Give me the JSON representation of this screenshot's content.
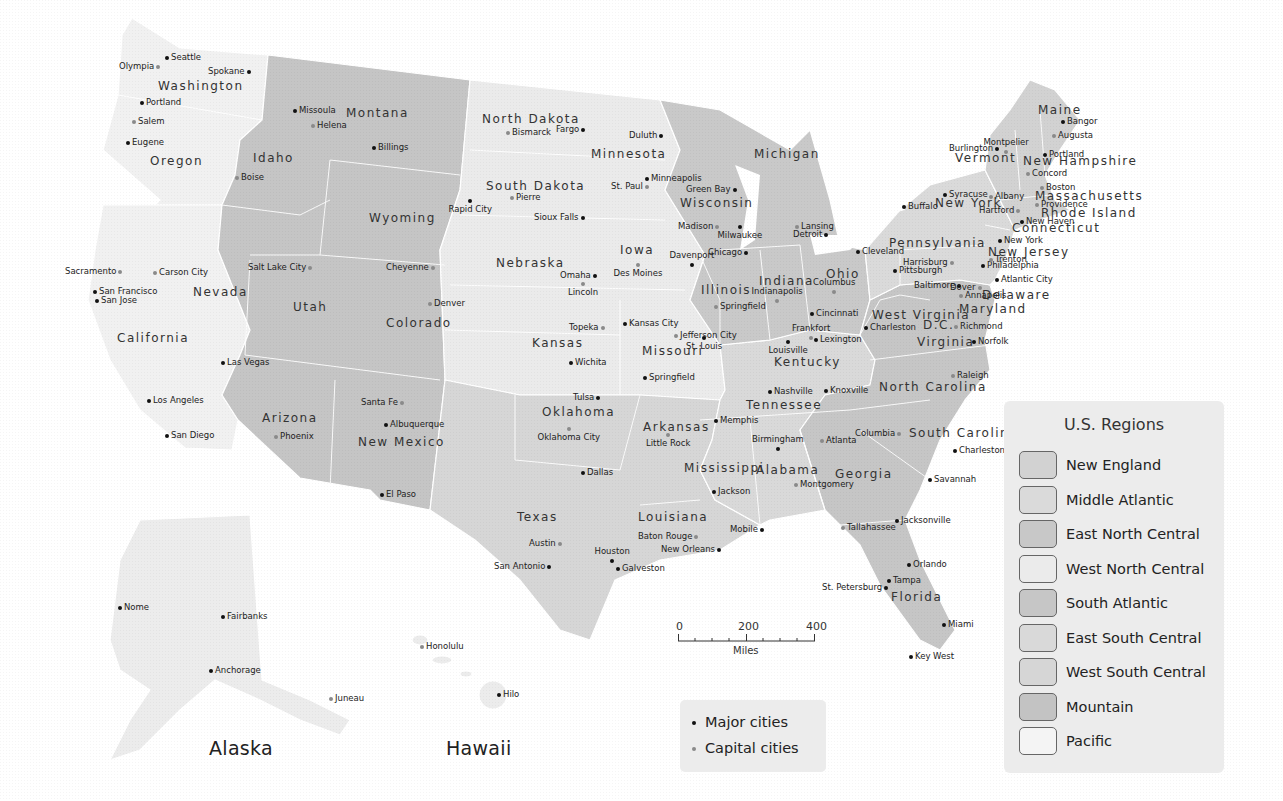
{
  "title": "U.S. Regions",
  "colors": {
    "new_england": "#d2d2d2",
    "middle_atlantic": "#dadada",
    "east_north_central": "#c8c8c8",
    "west_north_central": "#ebebeb",
    "south_atlantic": "#c6c6c6",
    "east_south_central": "#d9d9d9",
    "west_south_central": "#d6d6d6",
    "mountain": "#c3c3c3",
    "pacific": "#f2f2f2",
    "major_dot": "#111111",
    "capital_dot": "#8a8a8a"
  },
  "legend": {
    "title": "U.S. Regions",
    "items": [
      {
        "label": "New England",
        "color": "#d2d2d2"
      },
      {
        "label": "Middle Atlantic",
        "color": "#dadada"
      },
      {
        "label": "East North Central",
        "color": "#c8c8c8"
      },
      {
        "label": "West North Central",
        "color": "#ebebeb"
      },
      {
        "label": "South Atlantic",
        "color": "#c6c6c6"
      },
      {
        "label": "East South Central",
        "color": "#d9d9d9"
      },
      {
        "label": "West South Central",
        "color": "#d6d6d6"
      },
      {
        "label": "Mountain",
        "color": "#c3c3c3"
      },
      {
        "label": "Pacific",
        "color": "#f4f4f4"
      }
    ]
  },
  "city_legend": {
    "major": "Major cities",
    "capital": "Capital cities"
  },
  "scale": {
    "ticks": [
      "0",
      "200",
      "400"
    ],
    "unit": "Miles"
  },
  "insets": {
    "alaska": "Alaska",
    "hawaii": "Hawaii"
  },
  "states": [
    {
      "name": "Washington",
      "x": 158,
      "y": 80
    },
    {
      "name": "Oregon",
      "x": 150,
      "y": 155
    },
    {
      "name": "California",
      "x": 117,
      "y": 332
    },
    {
      "name": "Nevada",
      "x": 193,
      "y": 286
    },
    {
      "name": "Idaho",
      "x": 253,
      "y": 152
    },
    {
      "name": "Montana",
      "x": 346,
      "y": 107
    },
    {
      "name": "Wyoming",
      "x": 369,
      "y": 212
    },
    {
      "name": "Utah",
      "x": 293,
      "y": 301
    },
    {
      "name": "Colorado",
      "x": 386,
      "y": 317
    },
    {
      "name": "Arizona",
      "x": 262,
      "y": 412
    },
    {
      "name": "New Mexico",
      "x": 358,
      "y": 436
    },
    {
      "name": "North Dakota",
      "x": 482,
      "y": 113
    },
    {
      "name": "South Dakota",
      "x": 486,
      "y": 180
    },
    {
      "name": "Nebraska",
      "x": 496,
      "y": 257
    },
    {
      "name": "Kansas",
      "x": 532,
      "y": 337
    },
    {
      "name": "Oklahoma",
      "x": 542,
      "y": 406
    },
    {
      "name": "Texas",
      "x": 517,
      "y": 511
    },
    {
      "name": "Minnesota",
      "x": 591,
      "y": 148
    },
    {
      "name": "Iowa",
      "x": 620,
      "y": 244
    },
    {
      "name": "Missouri",
      "x": 642,
      "y": 345
    },
    {
      "name": "Arkansas",
      "x": 643,
      "y": 421
    },
    {
      "name": "Louisiana",
      "x": 638,
      "y": 511
    },
    {
      "name": "Wisconsin",
      "x": 680,
      "y": 197
    },
    {
      "name": "Illinois",
      "x": 701,
      "y": 284
    },
    {
      "name": "Michigan",
      "x": 754,
      "y": 148
    },
    {
      "name": "Indiana",
      "x": 759,
      "y": 275
    },
    {
      "name": "Ohio",
      "x": 826,
      "y": 268
    },
    {
      "name": "Kentucky",
      "x": 774,
      "y": 356
    },
    {
      "name": "Tennessee",
      "x": 746,
      "y": 399
    },
    {
      "name": "Mississippi",
      "x": 684,
      "y": 462
    },
    {
      "name": "Alabama",
      "x": 756,
      "y": 464
    },
    {
      "name": "Georgia",
      "x": 835,
      "y": 468
    },
    {
      "name": "Florida",
      "x": 891,
      "y": 591
    },
    {
      "name": "South Carolina",
      "x": 909,
      "y": 427
    },
    {
      "name": "North Carolina",
      "x": 879,
      "y": 381
    },
    {
      "name": "Virginia",
      "x": 917,
      "y": 336
    },
    {
      "name": "West Virginia",
      "x": 872,
      "y": 309
    },
    {
      "name": "D.C.",
      "x": 923,
      "y": 319
    },
    {
      "name": "Maryland",
      "x": 959,
      "y": 303
    },
    {
      "name": "Delaware",
      "x": 982,
      "y": 289
    },
    {
      "name": "Pennsylvania",
      "x": 889,
      "y": 237
    },
    {
      "name": "New Jersey",
      "x": 988,
      "y": 246
    },
    {
      "name": "New York",
      "x": 935,
      "y": 197
    },
    {
      "name": "Connecticut",
      "x": 1012,
      "y": 222
    },
    {
      "name": "Rhode Island",
      "x": 1041,
      "y": 207
    },
    {
      "name": "Massachusetts",
      "x": 1035,
      "y": 190
    },
    {
      "name": "Vermont",
      "x": 955,
      "y": 152
    },
    {
      "name": "New Hampshire",
      "x": 1023,
      "y": 155
    },
    {
      "name": "Maine",
      "x": 1038,
      "y": 104
    }
  ],
  "cities": [
    {
      "name": "Seattle",
      "type": "major",
      "x": 167,
      "y": 58,
      "side": "r"
    },
    {
      "name": "Olympia",
      "type": "capital",
      "x": 158,
      "y": 67,
      "side": "l"
    },
    {
      "name": "Spokane",
      "type": "major",
      "x": 249,
      "y": 72,
      "side": "l"
    },
    {
      "name": "Portland",
      "type": "major",
      "x": 142,
      "y": 103,
      "side": "r"
    },
    {
      "name": "Salem",
      "type": "capital",
      "x": 134,
      "y": 122,
      "side": "r"
    },
    {
      "name": "Eugene",
      "type": "major",
      "x": 128,
      "y": 143,
      "side": "r"
    },
    {
      "name": "Boise",
      "type": "capital",
      "x": 237,
      "y": 178,
      "side": "r"
    },
    {
      "name": "Missoula",
      "type": "major",
      "x": 295,
      "y": 111,
      "side": "r"
    },
    {
      "name": "Helena",
      "type": "capital",
      "x": 313,
      "y": 126,
      "side": "r"
    },
    {
      "name": "Billings",
      "type": "major",
      "x": 374,
      "y": 148,
      "side": "r"
    },
    {
      "name": "Cheyenne",
      "type": "capital",
      "x": 433,
      "y": 268,
      "side": "l"
    },
    {
      "name": "Salt Lake City",
      "type": "capital",
      "x": 310,
      "y": 268,
      "side": "l"
    },
    {
      "name": "Sacramento",
      "type": "capital",
      "x": 120,
      "y": 272,
      "side": "l"
    },
    {
      "name": "Carson City",
      "type": "capital",
      "x": 155,
      "y": 273,
      "side": "r"
    },
    {
      "name": "San Francisco",
      "type": "major",
      "x": 95,
      "y": 292,
      "side": "r"
    },
    {
      "name": "San Jose",
      "type": "major",
      "x": 97,
      "y": 301,
      "side": "r"
    },
    {
      "name": "Denver",
      "type": "capital",
      "x": 430,
      "y": 304,
      "side": "r"
    },
    {
      "name": "Las Vegas",
      "type": "major",
      "x": 223,
      "y": 363,
      "side": "r"
    },
    {
      "name": "Los Angeles",
      "type": "major",
      "x": 149,
      "y": 401,
      "side": "r"
    },
    {
      "name": "San Diego",
      "type": "major",
      "x": 167,
      "y": 436,
      "side": "r"
    },
    {
      "name": "Phoenix",
      "type": "capital",
      "x": 276,
      "y": 437,
      "side": "r"
    },
    {
      "name": "Santa Fe",
      "type": "capital",
      "x": 402,
      "y": 403,
      "side": "l"
    },
    {
      "name": "Albuquerque",
      "type": "major",
      "x": 386,
      "y": 425,
      "side": "r"
    },
    {
      "name": "El Paso",
      "type": "major",
      "x": 382,
      "y": 495,
      "side": "r"
    },
    {
      "name": "Bismarck",
      "type": "capital",
      "x": 508,
      "y": 133,
      "side": "r"
    },
    {
      "name": "Fargo",
      "type": "major",
      "x": 583,
      "y": 130,
      "side": "l"
    },
    {
      "name": "Rapid City",
      "type": "major",
      "x": 470,
      "y": 201,
      "side": "below"
    },
    {
      "name": "Pierre",
      "type": "capital",
      "x": 512,
      "y": 198,
      "side": "r"
    },
    {
      "name": "Sioux Falls",
      "type": "major",
      "x": 583,
      "y": 218,
      "side": "l"
    },
    {
      "name": "Omaha",
      "type": "major",
      "x": 595,
      "y": 276,
      "side": "l"
    },
    {
      "name": "Lincoln",
      "type": "capital",
      "x": 583,
      "y": 284,
      "side": "below"
    },
    {
      "name": "Topeka",
      "type": "capital",
      "x": 603,
      "y": 328,
      "side": "l"
    },
    {
      "name": "Wichita",
      "type": "major",
      "x": 571,
      "y": 363,
      "side": "r"
    },
    {
      "name": "Tulsa",
      "type": "major",
      "x": 598,
      "y": 398,
      "side": "l"
    },
    {
      "name": "Oklahoma City",
      "type": "capital",
      "x": 569,
      "y": 429,
      "side": "below"
    },
    {
      "name": "Dallas",
      "type": "major",
      "x": 583,
      "y": 473,
      "side": "r"
    },
    {
      "name": "Austin",
      "type": "capital",
      "x": 560,
      "y": 544,
      "side": "l"
    },
    {
      "name": "San Antonio",
      "type": "major",
      "x": 549,
      "y": 567,
      "side": "l"
    },
    {
      "name": "Houston",
      "type": "major",
      "x": 612,
      "y": 561,
      "side": "above"
    },
    {
      "name": "Galveston",
      "type": "major",
      "x": 618,
      "y": 569,
      "side": "r"
    },
    {
      "name": "Duluth",
      "type": "major",
      "x": 661,
      "y": 136,
      "side": "l"
    },
    {
      "name": "Minneapolis",
      "type": "major",
      "x": 647,
      "y": 179,
      "side": "r"
    },
    {
      "name": "St. Paul",
      "type": "capital",
      "x": 647,
      "y": 187,
      "side": "l"
    },
    {
      "name": "Des Moines",
      "type": "capital",
      "x": 638,
      "y": 265,
      "side": "below"
    },
    {
      "name": "Davenport",
      "type": "major",
      "x": 692,
      "y": 265,
      "side": "above"
    },
    {
      "name": "Kansas City",
      "type": "major",
      "x": 625,
      "y": 324,
      "side": "r"
    },
    {
      "name": "Jefferson City",
      "type": "capital",
      "x": 676,
      "y": 336,
      "side": "r"
    },
    {
      "name": "St. Louis",
      "type": "major",
      "x": 704,
      "y": 338,
      "side": "below"
    },
    {
      "name": "Springfield",
      "type": "major",
      "x": 645,
      "y": 378,
      "side": "r"
    },
    {
      "name": "Little Rock",
      "type": "capital",
      "x": 668,
      "y": 435,
      "side": "below"
    },
    {
      "name": "Memphis",
      "type": "major",
      "x": 716,
      "y": 421,
      "side": "r"
    },
    {
      "name": "Jackson",
      "type": "major",
      "x": 714,
      "y": 492,
      "side": "r"
    },
    {
      "name": "Baton Rouge",
      "type": "capital",
      "x": 696,
      "y": 537,
      "side": "l"
    },
    {
      "name": "New Orleans",
      "type": "major",
      "x": 719,
      "y": 550,
      "side": "l"
    },
    {
      "name": "Mobile",
      "type": "major",
      "x": 762,
      "y": 530,
      "side": "l"
    },
    {
      "name": "Green Bay",
      "type": "major",
      "x": 735,
      "y": 190,
      "side": "l"
    },
    {
      "name": "Madison",
      "type": "capital",
      "x": 717,
      "y": 227,
      "side": "l"
    },
    {
      "name": "Milwaukee",
      "type": "major",
      "x": 740,
      "y": 227,
      "side": "below"
    },
    {
      "name": "Chicago",
      "type": "major",
      "x": 746,
      "y": 253,
      "side": "l"
    },
    {
      "name": "Springfield",
      "type": "capital",
      "x": 716,
      "y": 307,
      "side": "r"
    },
    {
      "name": "Lansing",
      "type": "capital",
      "x": 797,
      "y": 227,
      "side": "r"
    },
    {
      "name": "Detroit",
      "type": "major",
      "x": 826,
      "y": 235,
      "side": "l"
    },
    {
      "name": "Indianapolis",
      "type": "capital",
      "x": 777,
      "y": 301,
      "side": "above"
    },
    {
      "name": "Columbus",
      "type": "capital",
      "x": 834,
      "y": 292,
      "side": "above"
    },
    {
      "name": "Cincinnati",
      "type": "major",
      "x": 812,
      "y": 314,
      "side": "r"
    },
    {
      "name": "Frankfort",
      "type": "capital",
      "x": 811,
      "y": 338,
      "side": "above"
    },
    {
      "name": "Lexington",
      "type": "major",
      "x": 816,
      "y": 340,
      "side": "r"
    },
    {
      "name": "Louisville",
      "type": "major",
      "x": 788,
      "y": 342,
      "side": "below"
    },
    {
      "name": "Nashville",
      "type": "major",
      "x": 770,
      "y": 392,
      "side": "r"
    },
    {
      "name": "Knoxville",
      "type": "major",
      "x": 826,
      "y": 391,
      "side": "r"
    },
    {
      "name": "Birmingham",
      "type": "major",
      "x": 778,
      "y": 449,
      "side": "above"
    },
    {
      "name": "Atlanta",
      "type": "capital",
      "x": 822,
      "y": 441,
      "side": "r"
    },
    {
      "name": "Montgomery",
      "type": "capital",
      "x": 796,
      "y": 485,
      "side": "r"
    },
    {
      "name": "Tallahassee",
      "type": "capital",
      "x": 843,
      "y": 528,
      "side": "r"
    },
    {
      "name": "Jacksonville",
      "type": "major",
      "x": 897,
      "y": 521,
      "side": "r"
    },
    {
      "name": "Orlando",
      "type": "major",
      "x": 909,
      "y": 565,
      "side": "r"
    },
    {
      "name": "Tampa",
      "type": "major",
      "x": 889,
      "y": 581,
      "side": "r"
    },
    {
      "name": "St. Petersburg",
      "type": "major",
      "x": 886,
      "y": 588,
      "side": "l"
    },
    {
      "name": "Miami",
      "type": "major",
      "x": 944,
      "y": 625,
      "side": "r"
    },
    {
      "name": "Key West",
      "type": "major",
      "x": 911,
      "y": 657,
      "side": "r"
    },
    {
      "name": "Columbia",
      "type": "capital",
      "x": 899,
      "y": 434,
      "side": "l"
    },
    {
      "name": "Charleston",
      "type": "major",
      "x": 955,
      "y": 451,
      "side": "r"
    },
    {
      "name": "Savannah",
      "type": "major",
      "x": 930,
      "y": 480,
      "side": "r"
    },
    {
      "name": "Raleigh",
      "type": "capital",
      "x": 953,
      "y": 376,
      "side": "r"
    },
    {
      "name": "Charleston",
      "type": "major",
      "x": 866,
      "y": 328,
      "side": "r"
    },
    {
      "name": "Richmond",
      "type": "capital",
      "x": 956,
      "y": 327,
      "side": "r"
    },
    {
      "name": "Norfolk",
      "type": "major",
      "x": 974,
      "y": 342,
      "side": "r"
    },
    {
      "name": "Cleveland",
      "type": "major",
      "x": 858,
      "y": 252,
      "side": "r"
    },
    {
      "name": "Pittsburgh",
      "type": "major",
      "x": 895,
      "y": 271,
      "side": "r"
    },
    {
      "name": "Harrisburg",
      "type": "capital",
      "x": 952,
      "y": 263,
      "side": "l"
    },
    {
      "name": "Baltimore",
      "type": "major",
      "x": 959,
      "y": 286,
      "side": "l"
    },
    {
      "name": "Annapolis",
      "type": "capital",
      "x": 961,
      "y": 296,
      "side": "r"
    },
    {
      "name": "Dover",
      "type": "capital",
      "x": 980,
      "y": 288,
      "side": "l"
    },
    {
      "name": "Atlantic City",
      "type": "major",
      "x": 997,
      "y": 280,
      "side": "r"
    },
    {
      "name": "Philadelphia",
      "type": "major",
      "x": 983,
      "y": 266,
      "side": "r"
    },
    {
      "name": "Trenton",
      "type": "capital",
      "x": 991,
      "y": 260,
      "side": "r"
    },
    {
      "name": "New York",
      "type": "major",
      "x": 1000,
      "y": 241,
      "side": "r"
    },
    {
      "name": "Buffalo",
      "type": "major",
      "x": 904,
      "y": 207,
      "side": "r"
    },
    {
      "name": "Syracuse",
      "type": "major",
      "x": 945,
      "y": 195,
      "side": "r"
    },
    {
      "name": "Albany",
      "type": "capital",
      "x": 991,
      "y": 197,
      "side": "r"
    },
    {
      "name": "Hartford",
      "type": "capital",
      "x": 1018,
      "y": 211,
      "side": "l"
    },
    {
      "name": "New Haven",
      "type": "major",
      "x": 1022,
      "y": 222,
      "side": "r"
    },
    {
      "name": "Providence",
      "type": "capital",
      "x": 1037,
      "y": 205,
      "side": "r"
    },
    {
      "name": "Boston",
      "type": "capital",
      "x": 1042,
      "y": 188,
      "side": "r"
    },
    {
      "name": "Concord",
      "type": "capital",
      "x": 1028,
      "y": 174,
      "side": "r"
    },
    {
      "name": "Portland",
      "type": "major",
      "x": 1045,
      "y": 155,
      "side": "r"
    },
    {
      "name": "Burlington",
      "type": "major",
      "x": 997,
      "y": 149,
      "side": "l"
    },
    {
      "name": "Montpelier",
      "type": "capital",
      "x": 1006,
      "y": 152,
      "side": "above"
    },
    {
      "name": "Augusta",
      "type": "capital",
      "x": 1054,
      "y": 136,
      "side": "r"
    },
    {
      "name": "Bangor",
      "type": "major",
      "x": 1063,
      "y": 122,
      "side": "r"
    },
    {
      "name": "Nome",
      "type": "major",
      "x": 120,
      "y": 608,
      "side": "r"
    },
    {
      "name": "Fairbanks",
      "type": "major",
      "x": 223,
      "y": 617,
      "side": "r"
    },
    {
      "name": "Anchorage",
      "type": "major",
      "x": 211,
      "y": 671,
      "side": "r"
    },
    {
      "name": "Juneau",
      "type": "capital",
      "x": 331,
      "y": 699,
      "side": "r"
    },
    {
      "name": "Honolulu",
      "type": "capital",
      "x": 422,
      "y": 647,
      "side": "r"
    },
    {
      "name": "Hilo",
      "type": "major",
      "x": 499,
      "y": 695,
      "side": "r"
    }
  ]
}
